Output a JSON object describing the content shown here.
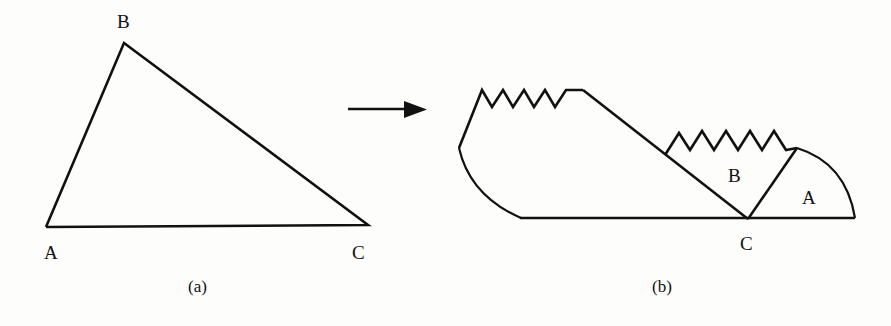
{
  "figure": {
    "ink_color": "#111111",
    "background_color": "#fdfdfc",
    "panels": [
      {
        "id": "panel-a",
        "caption": "(a)",
        "description": "Scalene triangle ABC",
        "vertex_labels": {
          "a": "A",
          "b": "B",
          "c": "C"
        },
        "vertices": {
          "A": [
            46,
            227
          ],
          "B": [
            124,
            43
          ],
          "C": [
            368,
            225
          ]
        }
      },
      {
        "id": "panel-b",
        "caption": "(b)",
        "description": "Triangle torn along zigzag lines, corners A and B folded to vertex C on a straight line",
        "vertex_labels": {
          "c": "C"
        },
        "region_labels": {
          "a": "A",
          "b": "B"
        },
        "baseline": [
          [
            520,
            218
          ],
          [
            855,
            218
          ]
        ],
        "apex": [
          748,
          219
        ]
      }
    ],
    "arrow": {
      "name": "transformation-arrow",
      "from": [
        348,
        109
      ],
      "to": [
        426,
        109
      ]
    }
  },
  "geometry": {
    "panel_a_triangle_points": "46,227 124,43 368,225 46,227",
    "panel_b_left_piece": "M 459,148 L 482,90 L 492,107 L 503,90 L 513,107 L 524,90 L 534,107 L 545,90 L 555,107 L 566,90 L 583,90",
    "panel_b_long_diagonal": "M 583,90 L 748,219",
    "panel_b_left_arc": "M 459,148 Q 470,196 521,218",
    "panel_b_baseline": "M 520,218 L 855,218",
    "panel_b_mid_zigzag": "M 665,155 L 679,133 L 690,150 L 702,131 L 714,150 L 726,131 L 738,150 L 750,131 L 762,150 L 774,131 L 786,150 L 797,148",
    "panel_b_wedge_edge": "M 748,219 L 797,148",
    "panel_b_right_arc": "M 797,148 Q 846,163 855,218"
  }
}
